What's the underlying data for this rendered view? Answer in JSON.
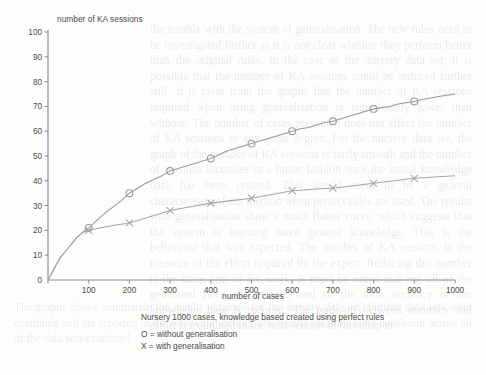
{
  "figure": {
    "background_color": "#fdfdfc",
    "axis_color": "#8a8a8a",
    "series_color_o": "#9a9a9a",
    "series_color_x": "#a6a6a6",
    "caption_line_1": "Nursery 1000 cases, knowledge based created using perfect rules",
    "legend_line_o": "O = without generalisation",
    "legend_line_x": "X = with generalisation"
  },
  "page_bleed": {
    "top_block": "the trouble with the system of generalisation. The new rules need to be investigated further as it is not clear whether they perform better than the original rules. In the case of the nursery data set, it is possible that the number of KA sessions could be reduced further still. It is clear from the graphs that the number of KA sessions required when using generalisation is significantly lower than without. The number of cases presented does not affect the number of KA sessions to any great degree. For the nursery data set, the graph of the number of KA sessions is fairly smooth and the number of sessions increases in a linear fashion once the initial knowledge base has been created. This would seem to be a general characteristic of the method when perfect rules are used. The results with generalisation show a much flatter curve, which suggests that the system is learning more general knowledge. This is the behaviour that was expected. The number of KA sessions is the measure of the effort required by the expert. Reducing this number is the main aim of the work. It must be noted that not all of the generated rules are correct, and so the total accuracy of the knowledge base is reduced. The trade-off between accuracy and effort is examined in the next section of this chapter.",
    "bottom_block": "The graphs above summarise the results obtained for the nursery data set. Further data sets were examined and are reported in the following section. The results obtained were consistent across all of the data sets examined."
  },
  "chart_data": {
    "type": "line",
    "title": "",
    "xlabel": "number of cases",
    "ylabel": "number of KA sessions",
    "xlim": [
      0,
      1000
    ],
    "ylim": [
      0,
      100
    ],
    "xticks": [
      0,
      100,
      200,
      300,
      400,
      500,
      600,
      700,
      800,
      900,
      1000
    ],
    "xtick_labels": [
      "",
      "100",
      "200",
      "300",
      "400",
      "500",
      "600",
      "700",
      "800",
      "900",
      "1000"
    ],
    "yticks": [
      0,
      10,
      20,
      30,
      40,
      50,
      60,
      70,
      80,
      90,
      100
    ],
    "ytick_labels": [
      "0",
      "10",
      "20",
      "30",
      "40",
      "50",
      "60",
      "70",
      "80",
      "90",
      "100"
    ],
    "grid": false,
    "legend_position": "below-plot",
    "series": [
      {
        "name": "without generalisation",
        "marker": "O",
        "marker_interval": 100,
        "x": [
          0,
          10,
          20,
          30,
          40,
          50,
          60,
          70,
          80,
          90,
          100,
          120,
          140,
          160,
          180,
          200,
          220,
          240,
          260,
          280,
          300,
          320,
          340,
          360,
          380,
          400,
          420,
          440,
          460,
          480,
          500,
          520,
          540,
          560,
          580,
          600,
          620,
          640,
          660,
          680,
          700,
          720,
          740,
          760,
          780,
          800,
          820,
          840,
          860,
          880,
          900,
          920,
          940,
          960,
          980,
          1000
        ],
        "y": [
          0,
          3,
          6,
          9,
          11,
          13,
          15,
          17,
          18.5,
          20,
          21,
          24,
          27,
          29.5,
          32,
          35,
          37,
          39,
          40.5,
          42,
          44,
          45,
          46,
          47,
          48,
          49,
          50.5,
          52,
          53,
          54,
          55,
          56,
          57,
          58,
          59,
          60,
          61,
          61.5,
          62.5,
          63.5,
          64,
          65,
          66,
          67,
          68,
          69,
          69.5,
          70,
          71,
          71.5,
          72,
          72.8,
          73.4,
          74,
          74.5,
          75
        ]
      },
      {
        "name": "with generalisation",
        "marker": "X",
        "marker_interval": 100,
        "x": [
          0,
          10,
          20,
          30,
          40,
          50,
          60,
          70,
          80,
          90,
          100,
          120,
          140,
          160,
          180,
          200,
          220,
          240,
          260,
          280,
          300,
          320,
          340,
          360,
          380,
          400,
          420,
          440,
          460,
          480,
          500,
          520,
          540,
          560,
          580,
          600,
          620,
          640,
          660,
          680,
          700,
          720,
          740,
          760,
          780,
          800,
          820,
          840,
          860,
          880,
          900,
          920,
          940,
          960,
          980,
          1000
        ],
        "y": [
          0,
          3,
          6,
          9,
          11,
          13,
          15,
          17,
          18.5,
          19.5,
          20,
          20.8,
          21.4,
          22,
          22.5,
          23,
          24,
          25,
          26,
          27,
          28,
          28.6,
          29.2,
          29.8,
          30.4,
          31,
          31.4,
          31.8,
          32.2,
          32.6,
          33,
          33.6,
          34.2,
          34.8,
          35.4,
          36,
          36.2,
          36.5,
          36.7,
          36.9,
          37,
          37.4,
          37.8,
          38.2,
          38.6,
          39,
          39.4,
          39.8,
          40.2,
          40.6,
          41,
          41.2,
          41.4,
          41.6,
          41.8,
          42
        ]
      }
    ]
  }
}
